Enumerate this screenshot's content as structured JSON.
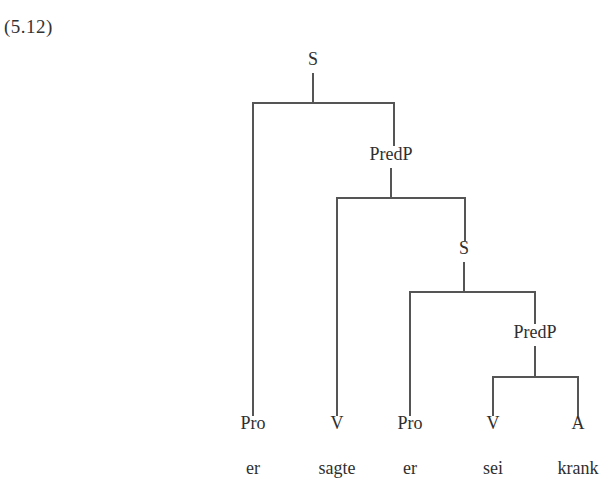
{
  "example": {
    "number": "(5.12)"
  },
  "diagram": {
    "kind": "syntax-tree",
    "language_of_example": "German",
    "sentence": "er sagte er sei krank",
    "line_color": "#555555",
    "text_color": "#2f2f2f",
    "background_color": "#ffffff",
    "nodes": [
      {
        "id": "s1",
        "label": "S",
        "x": 313,
        "y": 68,
        "level": 0
      },
      {
        "id": "predp1",
        "label": "PredP",
        "x": 391,
        "y": 163,
        "level": 1
      },
      {
        "id": "s2",
        "label": "S",
        "x": 464,
        "y": 257,
        "level": 2
      },
      {
        "id": "predp2",
        "label": "PredP",
        "x": 535,
        "y": 341,
        "level": 3
      }
    ],
    "terminals": [
      {
        "id": "t1",
        "category": "Pro",
        "word": "er",
        "x": 253
      },
      {
        "id": "t2",
        "category": "V",
        "word": "sagte",
        "x": 337
      },
      {
        "id": "t3",
        "category": "Pro",
        "word": "er",
        "x": 410
      },
      {
        "id": "t4",
        "category": "V",
        "word": "sei",
        "x": 493
      },
      {
        "id": "t5",
        "category": "A",
        "word": "krank",
        "x": 578
      }
    ],
    "category_baseline_y": 432,
    "word_baseline_y": 477,
    "branches": [
      {
        "parent": "s1",
        "children": [
          "t1",
          "predp1"
        ]
      },
      {
        "parent": "predp1",
        "children": [
          "t2",
          "s2"
        ]
      },
      {
        "parent": "s2",
        "children": [
          "t3",
          "predp2"
        ]
      },
      {
        "parent": "predp2",
        "children": [
          "t4",
          "t5"
        ]
      }
    ]
  }
}
